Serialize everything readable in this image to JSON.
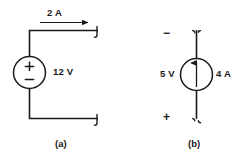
{
  "figure": {
    "background_color": "#ffffff",
    "line_color": "#1a1a1a",
    "text_color": "#1a1a1a",
    "panels": [
      {
        "caption": "(a)",
        "source_type": "independent-voltage-source",
        "value_label": "12 V",
        "terminal_polarity_top": "+",
        "terminal_polarity_bottom": "−",
        "current_label": "2 A",
        "current_direction": "right"
      },
      {
        "caption": "(b)",
        "source_type": "independent-current-source",
        "voltage_label": "5 V",
        "current_label": "4 A",
        "current_direction": "up",
        "terminal_polarity_top": "−",
        "terminal_polarity_bottom": "+"
      }
    ]
  },
  "panel_a": {
    "caption": "(a)",
    "current_label": "2 A",
    "voltage_label": "12 V",
    "plus_sign": "+",
    "minus_sign": "−"
  },
  "panel_b": {
    "caption": "(b)",
    "voltage_label": "5 V",
    "current_label": "4 A",
    "minus_sign": "−",
    "plus_sign": "+"
  }
}
